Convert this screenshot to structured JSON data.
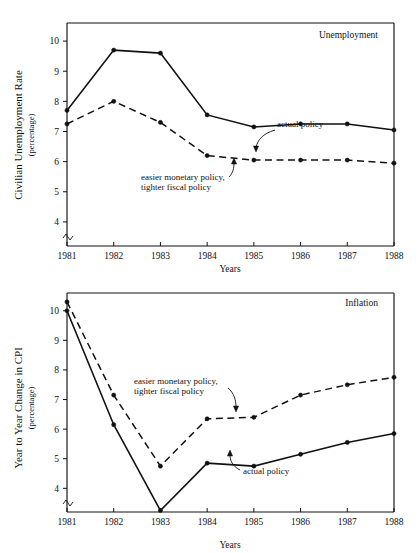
{
  "figure": {
    "xlabel": "Years",
    "years": [
      "1981",
      "1982",
      "1983",
      "1984",
      "1985",
      "1986",
      "1987",
      "1988"
    ]
  },
  "panels": [
    {
      "id": "unemployment",
      "title": "Unemployment",
      "ylabel_line1": "Civilian Unemployment Rate",
      "ylabel_line2": "(percentage)",
      "yticks": [
        "10",
        "9",
        "8",
        "7",
        "6",
        "5",
        "4"
      ],
      "annotation_actual": "actual policy",
      "annotation_alt_line1": "easier monetary policy,",
      "annotation_alt_line2": "tighter fiscal policy"
    },
    {
      "id": "inflation",
      "title": "Inflation",
      "ylabel_line1": "Year to Year Change in CPI",
      "ylabel_line2": "(percentage)",
      "yticks": [
        "10",
        "9",
        "8",
        "7",
        "6",
        "5",
        "4"
      ],
      "annotation_actual": "actual policy",
      "annotation_alt_line1": "easier monetary policy,",
      "annotation_alt_line2": "tighter fiscal policy"
    }
  ],
  "chart_data": [
    {
      "type": "line",
      "title": "Unemployment",
      "xlabel": "Years",
      "ylabel": "Civilian Unemployment Rate (percentage)",
      "categories": [
        "1981",
        "1982",
        "1983",
        "1984",
        "1985",
        "1986",
        "1987",
        "1988"
      ],
      "ylim": [
        3.2,
        10.6
      ],
      "ytick_values": [
        4,
        5,
        6,
        7,
        8,
        9,
        10
      ],
      "axis_break": true,
      "grid": false,
      "legend": "inline-annotations",
      "series": [
        {
          "name": "actual policy",
          "style": "solid",
          "values": [
            7.7,
            9.7,
            9.6,
            7.55,
            7.15,
            7.25,
            7.25,
            7.05
          ]
        },
        {
          "name": "easier monetary policy, tighter fiscal policy",
          "style": "dashed",
          "values": [
            7.25,
            8.0,
            7.3,
            6.2,
            6.05,
            6.05,
            6.05,
            5.95
          ]
        }
      ]
    },
    {
      "type": "line",
      "title": "Inflation",
      "xlabel": "Years",
      "ylabel": "Year to Year Change in CPI (percentage)",
      "categories": [
        "1981",
        "1982",
        "1983",
        "1984",
        "1985",
        "1986",
        "1987",
        "1988"
      ],
      "ylim": [
        3.2,
        10.6
      ],
      "ytick_values": [
        4,
        5,
        6,
        7,
        8,
        9,
        10
      ],
      "axis_break": true,
      "grid": false,
      "legend": "inline-annotations",
      "series": [
        {
          "name": "actual policy",
          "style": "solid",
          "values": [
            10.0,
            6.15,
            3.25,
            4.85,
            4.75,
            5.15,
            5.55,
            5.85
          ]
        },
        {
          "name": "easier monetary policy, tighter fiscal policy",
          "style": "dashed",
          "values": [
            10.3,
            7.15,
            4.75,
            6.35,
            6.4,
            7.15,
            7.5,
            7.75
          ]
        }
      ]
    }
  ]
}
